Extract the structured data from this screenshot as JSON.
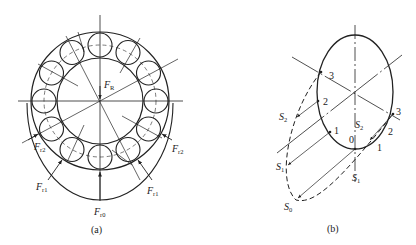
{
  "figure": {
    "panel_a": {
      "caption": "(a)",
      "labels": {
        "FR": {
          "main": "F",
          "sub": "R"
        },
        "Fr0": {
          "main": "F",
          "sub": "r0"
        },
        "Fr1_left": {
          "main": "F",
          "sub": "r1"
        },
        "Fr1_right": {
          "main": "F",
          "sub": "r1"
        },
        "Fr2_left": {
          "main": "F",
          "sub": "r2"
        },
        "Fr2_right": {
          "main": "F",
          "sub": "r2"
        }
      }
    },
    "panel_b": {
      "caption": "(b)",
      "labels": {
        "S0": {
          "main": "S",
          "sub": "0"
        },
        "S1_left": {
          "main": "S",
          "sub": "1"
        },
        "S1_center": {
          "main": "S",
          "sub": "1"
        },
        "S2_left": {
          "main": "S",
          "sub": "2"
        },
        "S2_center": {
          "main": "S",
          "sub": "2"
        }
      },
      "points_left": [
        "3",
        "2",
        "1"
      ],
      "points_right": [
        "0",
        "1",
        "2",
        "3"
      ]
    }
  }
}
